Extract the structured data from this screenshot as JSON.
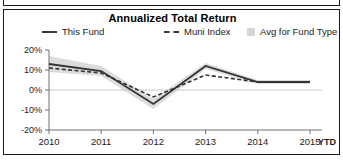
{
  "chart_data": {
    "type": "line",
    "title": "Annualized Total Return",
    "xlabel": "",
    "ylabel": "",
    "x": [
      "2010",
      "2011",
      "2012",
      "2013",
      "2014",
      "2015"
    ],
    "x_axis_note": "YTD",
    "ylim": [
      -20,
      20
    ],
    "ytick_labels": [
      "20%",
      "10%",
      "0%",
      "-10%",
      "-20%"
    ],
    "ytick_values": [
      20,
      10,
      0,
      -10,
      -20
    ],
    "grid": false,
    "legend_position": "top",
    "series": [
      {
        "name": "This Fund",
        "style": "solid",
        "values": [
          13,
          9.5,
          -7,
          12,
          4,
          4
        ]
      },
      {
        "name": "Muni Index",
        "style": "dashed",
        "values": [
          11,
          8.5,
          -3.5,
          7.5,
          4,
          4
        ]
      },
      {
        "name": "Avg for Fund Type",
        "style": "band",
        "upper": [
          17,
          12,
          -4.5,
          13.5,
          5,
          5
        ],
        "lower": [
          9,
          7,
          -9.5,
          10.5,
          3,
          3
        ]
      }
    ]
  },
  "chart": {
    "title": "Annualized Total Return",
    "legend": [
      {
        "label": "This Fund",
        "marker": "solid-line-swatch"
      },
      {
        "label": "Muni Index",
        "marker": "dashed-line-swatch"
      },
      {
        "label": "Avg for Fund Type",
        "marker": "band-square-swatch"
      }
    ],
    "y_ticks": [
      "20%",
      "10%",
      "0%",
      "-10%",
      "-20%"
    ],
    "x_ticks": [
      "2010",
      "2011",
      "2012",
      "2013",
      "2014",
      "2015"
    ],
    "ytd_label": "YTD"
  },
  "colors": {
    "line": "#333333",
    "band": "#dcdcdc",
    "axis": "#6e6e6e",
    "border": "#1b1b1b",
    "text": "#1b1b1b"
  }
}
